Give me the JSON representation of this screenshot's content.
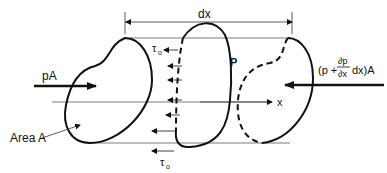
{
  "diagram": {
    "labels": {
      "dx": "dx",
      "pA": "pA",
      "P": "P",
      "x_axis": "x",
      "area": "Area A",
      "tau_top": "τ",
      "tau_top_sub": "o",
      "tau_bottom": "τ",
      "tau_bottom_sub": "o",
      "right_force_prefix": "(p +",
      "right_force_num": "∂p",
      "right_force_den": "∂x",
      "right_force_suffix": "dx)A"
    },
    "colors": {
      "stroke": "#111111",
      "thin": "#333333",
      "background": "#ffffff"
    }
  }
}
